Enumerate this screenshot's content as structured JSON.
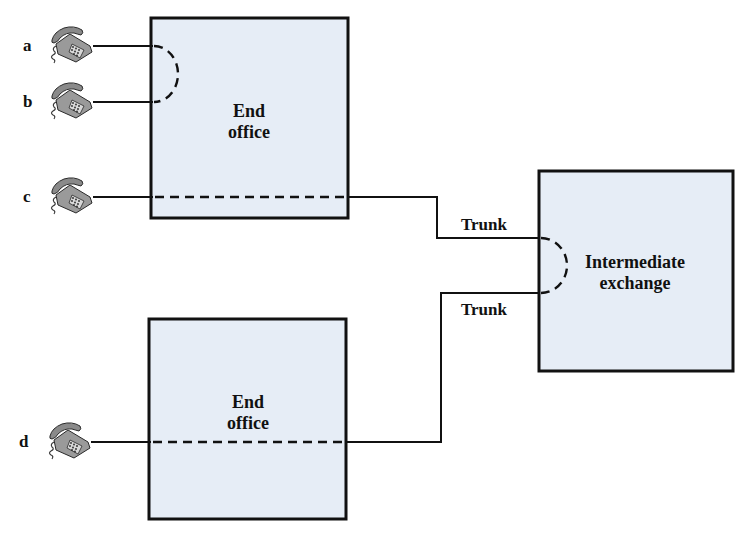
{
  "diagram": {
    "type": "telephone-network-circuit",
    "subscribers": [
      {
        "id": "a",
        "label": "a"
      },
      {
        "id": "b",
        "label": "b"
      },
      {
        "id": "c",
        "label": "c"
      },
      {
        "id": "d",
        "label": "d"
      }
    ],
    "nodes": {
      "end_office_top": {
        "line1": "End",
        "line2": "office"
      },
      "end_office_bottom": {
        "line1": "End",
        "line2": "office"
      },
      "intermediate_exchange": {
        "line1": "Intermediate",
        "line2": "exchange"
      }
    },
    "trunks": [
      {
        "id": "trunk-upper",
        "label": "Trunk"
      },
      {
        "id": "trunk-lower",
        "label": "Trunk"
      }
    ],
    "connections": [
      {
        "from": "a",
        "to": "b",
        "via": "end_office_top",
        "style": "dashed-arc"
      },
      {
        "from": "c",
        "to": "intermediate_exchange",
        "via": "end_office_top",
        "style": "dashed-through"
      },
      {
        "from": "d",
        "to": "intermediate_exchange",
        "via": "end_office_bottom",
        "style": "dashed-through"
      },
      {
        "from": "trunk-upper",
        "to": "trunk-lower",
        "via": "intermediate_exchange",
        "style": "dashed-arc"
      }
    ],
    "colors": {
      "box_fill": "#e6edf6",
      "stroke": "#111111",
      "phone": "#9a9a9a"
    }
  }
}
